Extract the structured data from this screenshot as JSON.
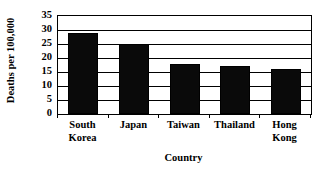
{
  "chart_data": {
    "type": "bar",
    "title": "",
    "subtitle": "",
    "xlabel": "Country",
    "ylabel": "Deaths per 100,000",
    "categories": [
      "South Korea",
      "Japan",
      "Taiwan",
      "Thailand",
      "Hong Kong"
    ],
    "values": [
      29,
      25,
      18,
      17,
      16
    ],
    "series": [
      {
        "name": "Deaths per 100,000",
        "values": [
          29,
          25,
          18,
          17,
          16
        ]
      }
    ],
    "ylim": [
      0,
      35
    ],
    "ytick_labels": [
      "0",
      "5",
      "10",
      "15",
      "20",
      "25",
      "30",
      "35"
    ],
    "ytick_values": [
      0,
      5,
      10,
      15,
      20,
      25,
      30,
      35
    ],
    "ytick_step": 5,
    "grid": "horizontal",
    "legend": "none",
    "bar_color": "#0a0a0a",
    "bar_border_color": "#000000",
    "axis_color": "#000000",
    "plot_background": "#ffffff",
    "annotations": []
  },
  "category_labels_wrapped": [
    [
      "South",
      "Korea"
    ],
    [
      "Japan"
    ],
    [
      "Taiwan"
    ],
    [
      "Thailand"
    ],
    [
      "Hong",
      "Kong"
    ]
  ]
}
